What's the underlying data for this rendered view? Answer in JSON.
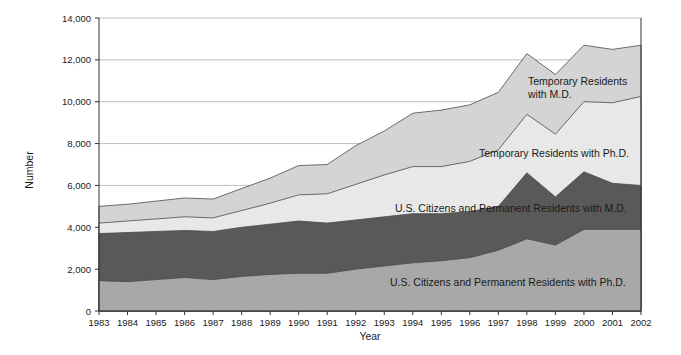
{
  "chart_data": {
    "type": "area",
    "stacked": true,
    "title": "",
    "xlabel": "Year",
    "ylabel": "Number",
    "grid": true,
    "legend_position": "inline-annotations",
    "xlim": [
      1983,
      2002
    ],
    "ylim": [
      0,
      14000
    ],
    "yticks": [
      0,
      2000,
      4000,
      6000,
      8000,
      10000,
      12000,
      14000
    ],
    "ytick_labels": [
      "0",
      "2,000",
      "4,000",
      "6,000",
      "8,000",
      "10,000",
      "12,000",
      "14,000"
    ],
    "categories": [
      1983,
      1984,
      1985,
      1986,
      1987,
      1988,
      1989,
      1990,
      1991,
      1992,
      1993,
      1994,
      1995,
      1996,
      1997,
      1998,
      1999,
      2000,
      2001,
      2002
    ],
    "xtick_labels": [
      "1983",
      "1984",
      "1985",
      "1986",
      "1987",
      "1988",
      "1989",
      "1990",
      "1991",
      "1992",
      "1993",
      "1994",
      "1995",
      "1996",
      "1997",
      "1998",
      "1999",
      "2000",
      "2001",
      "2002"
    ],
    "series": [
      {
        "name": "U.S. Citizens and Permanent Residents with Ph.D.",
        "color": "#a8a8a8",
        "label_text": "U.S. Citizens and Permanent Residents with Ph.D.",
        "values": [
          1450,
          1400,
          1500,
          1600,
          1500,
          1650,
          1750,
          1800,
          1800,
          2000,
          2150,
          2300,
          2400,
          2550,
          2900,
          3450,
          3150,
          3900,
          3900,
          3900
        ]
      },
      {
        "name": "U.S. Citizens and Permanent Residents with M.D.",
        "color": "#595959",
        "label_text": "U.S. Citizens and Permanent Residents with M.D.",
        "values": [
          2250,
          2350,
          2300,
          2250,
          2300,
          2350,
          2400,
          2500,
          2400,
          2350,
          2350,
          2350,
          2250,
          2200,
          2100,
          3150,
          2300,
          2750,
          2200,
          2100
        ]
      },
      {
        "name": "Temporary Residents with Ph.D.",
        "color": "#e8e8e8",
        "label_text": "Temporary Residents with Ph.D.",
        "values": [
          500,
          550,
          600,
          650,
          650,
          800,
          1000,
          1250,
          1400,
          1700,
          2000,
          2250,
          2250,
          2400,
          2700,
          2800,
          3000,
          3350,
          3850,
          4250
        ]
      },
      {
        "name": "Temporary Residents with M.D.",
        "color": "#d4d4d4",
        "label_text": "Temporary Residents with M.D.",
        "values": [
          800,
          800,
          850,
          900,
          900,
          1050,
          1200,
          1400,
          1400,
          1850,
          2100,
          2550,
          2700,
          2700,
          2750,
          2900,
          2850,
          2700,
          2550,
          2450
        ]
      }
    ],
    "stack_tops": {
      "series1": [
        1450,
        1400,
        1500,
        1600,
        1500,
        1650,
        1750,
        1800,
        1800,
        2000,
        2150,
        2300,
        2400,
        2550,
        2900,
        3450,
        3150,
        3900,
        3900,
        3900
      ],
      "series2": [
        3700,
        3750,
        3800,
        3850,
        3800,
        4000,
        4150,
        4300,
        4200,
        4350,
        4500,
        4650,
        4650,
        4750,
        5000,
        6600,
        5450,
        6650,
        6100,
        6000
      ],
      "series3": [
        4200,
        4300,
        4400,
        4500,
        4450,
        4800,
        5150,
        5550,
        5600,
        6050,
        6500,
        6900,
        6900,
        7150,
        7700,
        9400,
        8450,
        10000,
        9950,
        10250
      ],
      "series4": [
        5000,
        5100,
        5250,
        5400,
        5350,
        5850,
        6350,
        6950,
        7000,
        7900,
        8600,
        9450,
        9600,
        9850,
        10450,
        12300,
        11300,
        12700,
        12500,
        12700
      ]
    }
  },
  "axes": {
    "y_axis_title": "Number",
    "x_axis_title": "Year"
  }
}
